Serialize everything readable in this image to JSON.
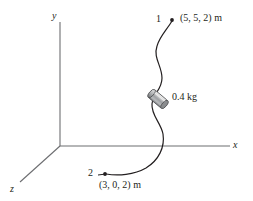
{
  "figure": {
    "background_color": "#ffffff",
    "line_color": "#231f20",
    "axis_color": "#6d6e71",
    "text_color": "#231f20",
    "collar_color_light": "#d9d9d9",
    "collar_color_mid": "#a7a9ac",
    "collar_color_dark": "#6d6e71"
  },
  "axes": {
    "origin": {
      "x": 60,
      "y": 146
    },
    "items": [
      {
        "name": "y",
        "label": "y",
        "tip": {
          "x": 60,
          "y": 22
        }
      },
      {
        "name": "x",
        "label": "x",
        "tip": {
          "x": 230,
          "y": 146
        }
      },
      {
        "name": "z",
        "label": "z",
        "tip": {
          "x": 20,
          "y": 182
        }
      }
    ]
  },
  "points": [
    {
      "name": "point-1",
      "number": "1",
      "coordinates": "(5, 5, 2) m",
      "marker": {
        "x": 172,
        "y": 20
      }
    },
    {
      "name": "point-2",
      "number": "2",
      "coordinates": "(3, 0, 2) m",
      "marker": {
        "x": 105,
        "y": 174
      }
    }
  ],
  "collar": {
    "name": "sliding-collar",
    "mass_label": "0.4 kg",
    "position": {
      "x": 158,
      "y": 99
    },
    "angle_deg": 40
  },
  "curve": {
    "name": "wire-path",
    "path": "M 172 21 C 166 31 160 36 157 46 C 153 58 162 66 162 78 C 162 90 153 93 152 104 C 151 115 161 123 163 134 C 165 147 159 160 146 168 C 134 175 118 176 106 174",
    "stroke_width": 1.2
  }
}
